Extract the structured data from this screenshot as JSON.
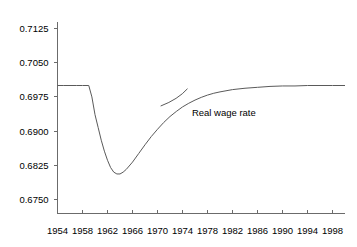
{
  "chart_data": {
    "type": "line",
    "title": "",
    "subtitle": "",
    "xlabel": "",
    "ylabel": "",
    "xlim": [
      1954,
      2000
    ],
    "ylim": [
      0.675,
      0.715
    ],
    "grid": false,
    "legend_position": "none",
    "x_ticks": [
      1954,
      1958,
      1962,
      1966,
      1970,
      1974,
      1978,
      1982,
      1986,
      1990,
      1994,
      1998
    ],
    "x_tick_labels": [
      "1954",
      "1958",
      "1962",
      "1966",
      "1970",
      "1974",
      "1978",
      "1982",
      "1986",
      "1990",
      "1994",
      "1998"
    ],
    "y_ticks": [
      0.675,
      0.6825,
      0.69,
      0.6975,
      0.705,
      0.7125
    ],
    "y_tick_labels": [
      "0.6750",
      "0.6825",
      "0.6900",
      "0.6975",
      "0.7050",
      "0.7125"
    ],
    "series": [
      {
        "name": "Real wage rate",
        "color": "#5a5a5a",
        "x": [
          1954,
          1955,
          1956,
          1957,
          1958,
          1959,
          1959.5,
          1960,
          1960.5,
          1961,
          1961.5,
          1962,
          1962.5,
          1963,
          1963.5,
          1964,
          1964.5,
          1965,
          1966,
          1967,
          1968,
          1969,
          1970,
          1971,
          1972,
          1973,
          1974,
          1975,
          1976,
          1977,
          1978,
          1979,
          1980,
          1982,
          1984,
          1986,
          1988,
          1990,
          1992,
          1994,
          1996,
          1998,
          2000
        ],
        "y": [
          0.7,
          0.7,
          0.7,
          0.7,
          0.7,
          0.7,
          0.6975,
          0.6936,
          0.6908,
          0.688,
          0.6856,
          0.6836,
          0.682,
          0.681,
          0.6806,
          0.6806,
          0.681,
          0.6816,
          0.6832,
          0.6851,
          0.687,
          0.6888,
          0.6904,
          0.6919,
          0.6932,
          0.6943,
          0.6953,
          0.6961,
          0.6968,
          0.6974,
          0.6979,
          0.6983,
          0.6986,
          0.6991,
          0.6994,
          0.6996,
          0.6998,
          0.6999,
          0.6999,
          0.7,
          0.7,
          0.7,
          0.7
        ]
      }
    ],
    "annotations": [
      {
        "text": "Real wage rate",
        "x": 1975.5,
        "y": 0.6934,
        "leader_from_x": 1970.5,
        "leader_from_y": 0.6955,
        "leader_to_x": 1974.8,
        "leader_to_y": 0.6993
      }
    ]
  },
  "axes": {
    "axis_color": "#6b6b6b"
  }
}
